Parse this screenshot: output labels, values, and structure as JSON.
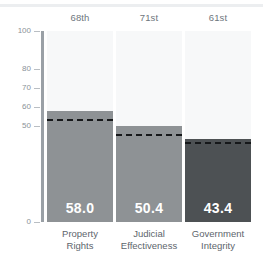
{
  "chart_data": {
    "type": "bar",
    "title": "",
    "subtitle": "",
    "xlabel": "",
    "ylabel": "",
    "ylim": [
      0,
      100
    ],
    "grid": false,
    "legend_position": "none",
    "categories": [
      "Property Rights",
      "Judicial Effectiveness",
      "Government Integrity"
    ],
    "category_lines": [
      [
        "Property",
        "Rights"
      ],
      [
        "Judicial",
        "Effectiveness"
      ],
      [
        "Government",
        "Integrity"
      ]
    ],
    "values": [
      58.0,
      50.4,
      43.4
    ],
    "value_labels": [
      "58.0",
      "50.4",
      "43.4"
    ],
    "rank_labels": [
      "68th",
      "71st",
      "61st"
    ],
    "reference_lines": [
      54.0,
      46.0,
      42.0
    ],
    "reference_line_style": "dashed",
    "y_ticks": [
      0,
      50,
      60,
      70,
      80,
      100
    ],
    "y_tick_labels": [
      "0",
      "50",
      "60",
      "70",
      "80",
      "100"
    ],
    "bar_colors": [
      "#8e9295",
      "#8e9295",
      "#4d5154"
    ],
    "column_background_color": "#f7f8f9",
    "axis_color": "#9aa0a6"
  },
  "axis": {
    "ticks": [
      {
        "label": "100",
        "value": 100
      },
      {
        "label": "80",
        "value": 80
      },
      {
        "label": "70",
        "value": 70
      },
      {
        "label": "60",
        "value": 60
      },
      {
        "label": "50",
        "value": 50
      },
      {
        "label": "0",
        "value": 0
      }
    ]
  },
  "series": [
    {
      "rank": "68th",
      "value_label": "58.0",
      "value": 58.0,
      "reference": 54.0,
      "name_line1": "Property",
      "name_line2": "Rights",
      "color": "#8e9295"
    },
    {
      "rank": "71st",
      "value_label": "50.4",
      "value": 50.4,
      "reference": 46.0,
      "name_line1": "Judicial",
      "name_line2": "Effectiveness",
      "color": "#8e9295"
    },
    {
      "rank": "61st",
      "value_label": "43.4",
      "value": 43.4,
      "reference": 42.0,
      "name_line1": "Government",
      "name_line2": "Integrity",
      "color": "#4d5154"
    }
  ]
}
